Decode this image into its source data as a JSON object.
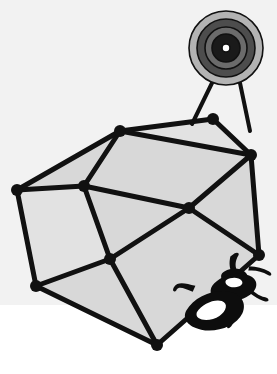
{
  "scene": {
    "title": "Polyhedron with bullseye target and rhinoceros beetle",
    "width": 277,
    "height": 374,
    "background_color": "#ffffff",
    "ground_band_color": "#f2f2f2",
    "ground_band_y": 305
  },
  "palette": {
    "ink": "#111111",
    "facet_fill": "#d8d8d8",
    "facet_fill_light": "#e2e2e2",
    "target_outer_ring": "#b3b3b3",
    "target_mid_ring": "#4d4d4d",
    "target_inner_ring": "#6b6b6b",
    "target_core_ring": "#1a1a1a",
    "target_bull": "#ffffff",
    "beetle": "#0d0d0d",
    "white": "#ffffff"
  },
  "polyhedron": {
    "label": "faceted polyhedron",
    "fill": "#d8d8d8",
    "stroke": "#111111",
    "stroke_width": 5,
    "vertex_radius": 6,
    "vertices": [
      {
        "name": "vertex-top-left",
        "x": 120,
        "y": 131
      },
      {
        "name": "vertex-top-right",
        "x": 213,
        "y": 119
      },
      {
        "name": "vertex-right-upper",
        "x": 251,
        "y": 155
      },
      {
        "name": "vertex-right-lower",
        "x": 259,
        "y": 255
      },
      {
        "name": "vertex-bottom",
        "x": 157,
        "y": 345
      },
      {
        "name": "vertex-left-lower",
        "x": 36,
        "y": 286
      },
      {
        "name": "vertex-left-upper",
        "x": 17,
        "y": 190
      },
      {
        "name": "vertex-inner-mid",
        "x": 84,
        "y": 186
      },
      {
        "name": "vertex-inner-center",
        "x": 189,
        "y": 208
      },
      {
        "name": "vertex-inner-lower",
        "x": 110,
        "y": 259
      }
    ],
    "outline_path": "M 120,131 L 213,119 L 251,155 L 259,255 L 157,345 L 36,286 L 17,190 Z",
    "interior_edges": [
      {
        "name": "edge-tl-to-inner-mid",
        "from": "vertex-top-left",
        "to": "vertex-inner-mid"
      },
      {
        "name": "edge-inner-mid-to-left-up",
        "from": "vertex-inner-mid",
        "to": "vertex-left-upper"
      },
      {
        "name": "edge-inner-mid-to-lower",
        "from": "vertex-inner-mid",
        "to": "vertex-inner-lower"
      },
      {
        "name": "edge-inner-mid-to-center",
        "from": "vertex-inner-mid",
        "to": "vertex-inner-center"
      },
      {
        "name": "edge-center-to-right-up",
        "from": "vertex-inner-center",
        "to": "vertex-right-upper"
      },
      {
        "name": "edge-center-to-right-low",
        "from": "vertex-inner-center",
        "to": "vertex-right-lower"
      },
      {
        "name": "edge-center-to-lower",
        "from": "vertex-inner-center",
        "to": "vertex-inner-lower"
      },
      {
        "name": "edge-lower-to-left-lower",
        "from": "vertex-inner-lower",
        "to": "vertex-left-lower"
      },
      {
        "name": "edge-lower-to-bottom",
        "from": "vertex-inner-lower",
        "to": "vertex-bottom"
      },
      {
        "name": "edge-tl-to-right-upper",
        "from": "vertex-top-left",
        "to": "vertex-right-upper"
      }
    ]
  },
  "target": {
    "label": "bullseye target on stand",
    "center_x": 226,
    "center_y": 48,
    "rings": [
      {
        "name": "target-ring-outer",
        "radius": 37,
        "color": "#b3b3b3"
      },
      {
        "name": "target-ring-mid",
        "radius": 29,
        "color": "#4d4d4d"
      },
      {
        "name": "target-ring-inner",
        "radius": 21,
        "color": "#6b6b6b"
      },
      {
        "name": "target-ring-core",
        "radius": 14,
        "color": "#1a1a1a"
      },
      {
        "name": "target-bullseye",
        "radius": 4,
        "color": "#ffffff"
      }
    ],
    "legs": [
      {
        "name": "target-leg-left",
        "x1": 212,
        "y1": 83,
        "x2": 192,
        "y2": 124
      },
      {
        "name": "target-leg-right",
        "x1": 240,
        "y1": 83,
        "x2": 250,
        "y2": 131
      }
    ],
    "leg_width": 4
  },
  "beetle": {
    "label": "rhinoceros beetle silhouette",
    "color": "#0d0d0d",
    "anchor_x": 160,
    "anchor_y": 272,
    "rotation_deg": -14,
    "scale": 1.0,
    "parts": [
      "horn",
      "head",
      "pronotum",
      "elytra",
      "legs"
    ]
  }
}
